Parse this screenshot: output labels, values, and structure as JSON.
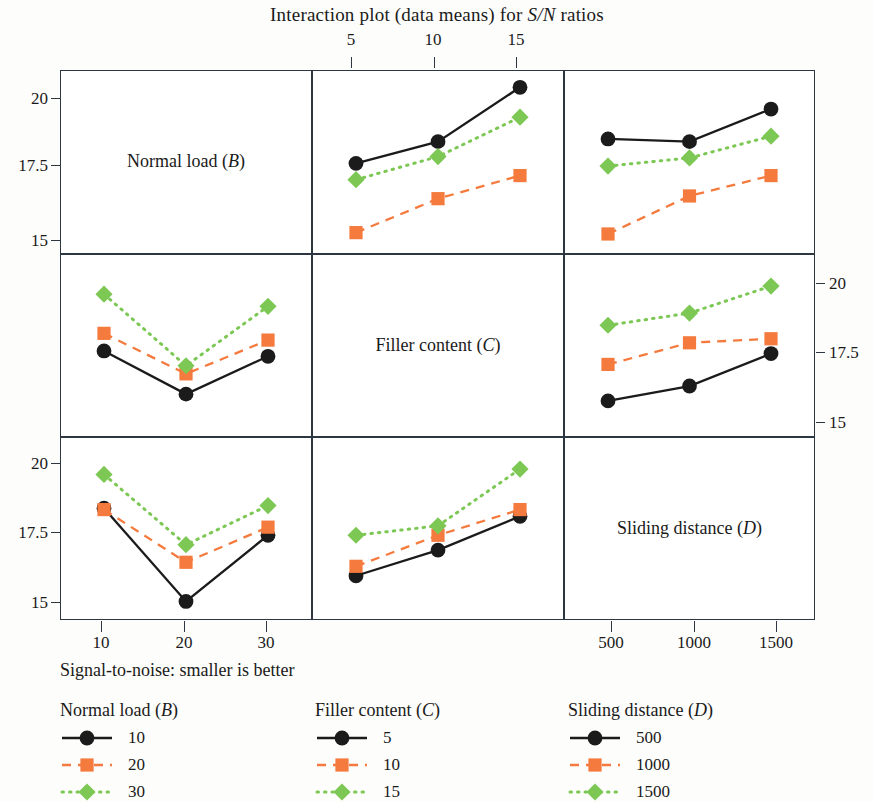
{
  "title": "Interaction plot (data means) for S/N ratios",
  "title_plain": "Interaction plot (data means) for ",
  "title_italic": "S/N",
  "title_tail": " ratios",
  "footnote": "Signal-to-noise: smaller is better",
  "colors": {
    "black": "#1b1b1b",
    "orange": "#F57A3D",
    "green": "#7DC855",
    "frame": "#2c3742",
    "background": "#ffffff"
  },
  "diagonal_labels": [
    {
      "text": "Normal load (",
      "italic": "B",
      "tail": ")"
    },
    {
      "text": "Filler content (",
      "italic": "C",
      "tail": ")"
    },
    {
      "text": "Sliding distance (",
      "italic": "D",
      "tail": ")"
    }
  ],
  "axes": {
    "top_ticks": [
      "5",
      "10",
      "15"
    ],
    "bottom_left_ticks": [
      "10",
      "20",
      "30"
    ],
    "bottom_right_ticks": [
      "500",
      "1000",
      "1500"
    ],
    "left_ticks_row1": [
      "20",
      "17.5",
      "15"
    ],
    "left_ticks_row3": [
      "20",
      "17.5",
      "15"
    ],
    "right_ticks_row2": [
      "20",
      "17.5",
      "15"
    ],
    "y_range": [
      14.3,
      21.0
    ]
  },
  "legends": [
    {
      "title_text": "Normal load (",
      "title_italic": "B",
      "title_tail": ")",
      "name": "Normal load (B)",
      "entries": [
        {
          "label": "10",
          "style": "solid",
          "marker": "circle",
          "color": "#1b1b1b"
        },
        {
          "label": "20",
          "style": "dashed",
          "marker": "square",
          "color": "#F57A3D"
        },
        {
          "label": "30",
          "style": "dotted",
          "marker": "diamond",
          "color": "#7DC855"
        }
      ]
    },
    {
      "title_text": "Filler content (",
      "title_italic": "C",
      "title_tail": ")",
      "name": "Filler content (C)",
      "entries": [
        {
          "label": "5",
          "style": "solid",
          "marker": "circle",
          "color": "#1b1b1b"
        },
        {
          "label": "10",
          "style": "dashed",
          "marker": "square",
          "color": "#F57A3D"
        },
        {
          "label": "15",
          "style": "dotted",
          "marker": "diamond",
          "color": "#7DC855"
        }
      ]
    },
    {
      "title_text": "Sliding distance (",
      "title_italic": "D",
      "title_tail": ")",
      "name": "Sliding distance (D)",
      "entries": [
        {
          "label": "500",
          "style": "solid",
          "marker": "circle",
          "color": "#1b1b1b"
        },
        {
          "label": "1000",
          "style": "dashed",
          "marker": "square",
          "color": "#F57A3D"
        },
        {
          "label": "1500",
          "style": "dotted",
          "marker": "diamond",
          "color": "#7DC855"
        }
      ]
    }
  ],
  "chart_data": {
    "type": "line",
    "title": "Interaction plot (data means) for S/N ratios",
    "subtitle": "Signal-to-noise: smaller is better",
    "ylabel": "S/N ratio",
    "ylim": [
      14.3,
      21.0
    ],
    "grid": false,
    "legend_position": "bottom",
    "layout": "3x3 interaction matrix, diagonal cells hold factor names",
    "factors": [
      {
        "symbol": "B",
        "name": "Normal load",
        "levels": [
          10,
          20,
          30
        ]
      },
      {
        "symbol": "C",
        "name": "Filler content",
        "levels": [
          5,
          10,
          15
        ]
      },
      {
        "symbol": "D",
        "name": "Sliding distance",
        "levels": [
          500,
          1000,
          1500
        ]
      }
    ],
    "panels": [
      {
        "row": 1,
        "col": 2,
        "x_factor": "Filler content (C)",
        "trace_factor": "Normal load (B)",
        "x": [
          5,
          10,
          15
        ],
        "series": [
          {
            "name": "10",
            "color": "#1b1b1b",
            "marker": "circle",
            "style": "solid",
            "values": [
              17.6,
              18.4,
              20.4
            ]
          },
          {
            "name": "20",
            "color": "#F57A3D",
            "marker": "square",
            "style": "dashed",
            "values": [
              15.05,
              16.3,
              17.15
            ]
          },
          {
            "name": "30",
            "color": "#7DC855",
            "marker": "diamond",
            "style": "dotted",
            "values": [
              17.0,
              17.85,
              19.3
            ]
          }
        ]
      },
      {
        "row": 1,
        "col": 3,
        "x_factor": "Sliding distance (D)",
        "trace_factor": "Normal load (B)",
        "x": [
          500,
          1000,
          1500
        ],
        "series": [
          {
            "name": "10",
            "color": "#1b1b1b",
            "marker": "circle",
            "style": "solid",
            "values": [
              18.5,
              18.4,
              19.6
            ]
          },
          {
            "name": "20",
            "color": "#F57A3D",
            "marker": "square",
            "style": "dashed",
            "values": [
              15.0,
              16.4,
              17.15
            ]
          },
          {
            "name": "30",
            "color": "#7DC855",
            "marker": "diamond",
            "style": "dotted",
            "values": [
              17.5,
              17.8,
              18.6
            ]
          }
        ]
      },
      {
        "row": 2,
        "col": 1,
        "x_factor": "Normal load (B)",
        "trace_factor": "Filler content (C)",
        "x": [
          10,
          20,
          30
        ],
        "series": [
          {
            "name": "5",
            "color": "#1b1b1b",
            "marker": "circle",
            "style": "solid",
            "values": [
              17.45,
              15.85,
              17.25
            ]
          },
          {
            "name": "10",
            "color": "#F57A3D",
            "marker": "square",
            "style": "dashed",
            "values": [
              18.1,
              16.6,
              17.85
            ]
          },
          {
            "name": "15",
            "color": "#7DC855",
            "marker": "diamond",
            "style": "dotted",
            "values": [
              19.55,
              16.9,
              19.1
            ]
          }
        ]
      },
      {
        "row": 2,
        "col": 3,
        "x_factor": "Sliding distance (D)",
        "trace_factor": "Filler content (C)",
        "x": [
          500,
          1000,
          1500
        ],
        "series": [
          {
            "name": "5",
            "color": "#1b1b1b",
            "marker": "circle",
            "style": "solid",
            "values": [
              15.6,
              16.15,
              17.35
            ]
          },
          {
            "name": "10",
            "color": "#F57A3D",
            "marker": "square",
            "style": "dashed",
            "values": [
              16.95,
              17.75,
              17.9
            ]
          },
          {
            "name": "15",
            "color": "#7DC855",
            "marker": "diamond",
            "style": "dotted",
            "values": [
              18.4,
              18.85,
              19.85
            ]
          }
        ]
      },
      {
        "row": 3,
        "col": 1,
        "x_factor": "Normal load (B)",
        "trace_factor": "Sliding distance (D)",
        "x": [
          10,
          20,
          30
        ],
        "series": [
          {
            "name": "500",
            "color": "#1b1b1b",
            "marker": "circle",
            "style": "solid",
            "values": [
              18.4,
              14.95,
              17.4
            ]
          },
          {
            "name": "1000",
            "color": "#F57A3D",
            "marker": "square",
            "style": "dashed",
            "values": [
              18.35,
              16.4,
              17.7
            ]
          },
          {
            "name": "1500",
            "color": "#7DC855",
            "marker": "diamond",
            "style": "dotted",
            "values": [
              19.65,
              17.05,
              18.5
            ]
          }
        ]
      },
      {
        "row": 3,
        "col": 2,
        "x_factor": "Filler content (C)",
        "trace_factor": "Sliding distance (D)",
        "x": [
          5,
          10,
          15
        ],
        "series": [
          {
            "name": "500",
            "color": "#1b1b1b",
            "marker": "circle",
            "style": "solid",
            "values": [
              15.9,
              16.85,
              18.1
            ]
          },
          {
            "name": "1000",
            "color": "#F57A3D",
            "marker": "square",
            "style": "dashed",
            "values": [
              16.25,
              17.4,
              18.35
            ]
          },
          {
            "name": "1500",
            "color": "#7DC855",
            "marker": "diamond",
            "style": "dotted",
            "values": [
              17.4,
              17.75,
              19.85
            ]
          }
        ]
      }
    ]
  }
}
